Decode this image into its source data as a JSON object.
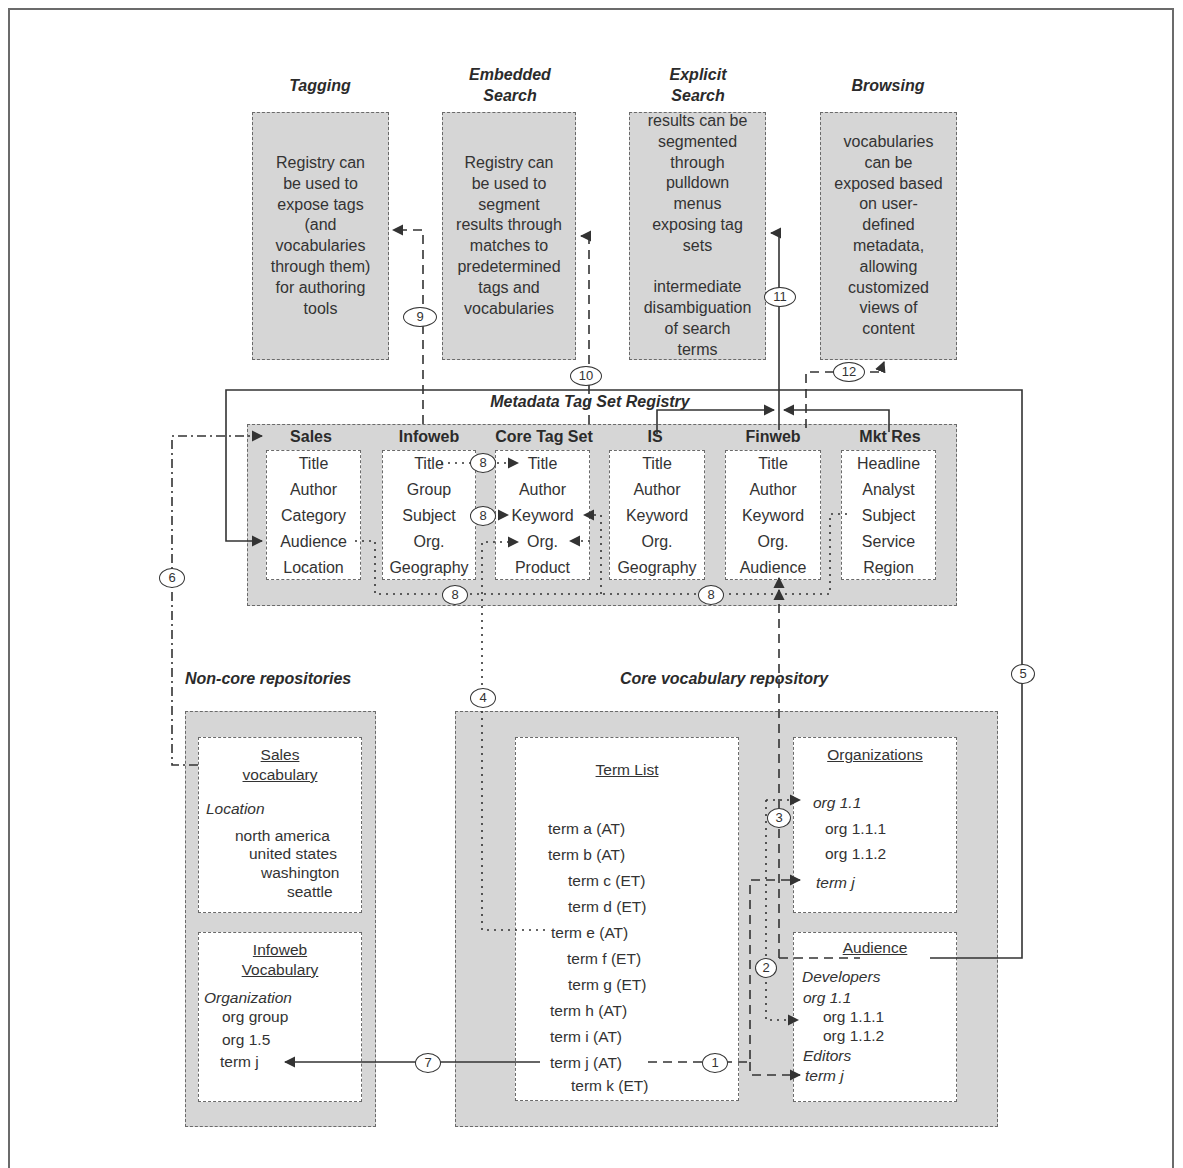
{
  "use_cases": [
    {
      "id": "tagging",
      "heading": "Tagging",
      "text": [
        "Registry can",
        "be used to",
        "expose tags",
        "(and",
        "vocabularies",
        "through them)",
        "for authoring",
        "tools"
      ]
    },
    {
      "id": "embedded-search",
      "heading": "Embedded Search",
      "heading_lines": [
        "Embedded",
        "Search"
      ],
      "text": [
        "Registry can",
        "be used to",
        "segment",
        "results through",
        "matches to",
        "predetermined",
        "tags and",
        "vocabularies"
      ]
    },
    {
      "id": "explicit-search",
      "heading": "Explicit Search",
      "heading_lines": [
        "Explicit",
        "Search"
      ],
      "text": [
        "results can be",
        "segmented",
        "through",
        "pulldown",
        "menus",
        "exposing tag",
        "sets",
        "",
        "intermediate",
        "disambiguation",
        "of search",
        "terms"
      ]
    },
    {
      "id": "browsing",
      "heading": "Browsing",
      "text": [
        "vocabularies",
        "can be",
        "exposed based",
        "on user-",
        "defined",
        "metadata,",
        "allowing",
        "customized",
        "views of",
        "content"
      ]
    }
  ],
  "registry": {
    "title": "Metadata Tag Set Registry",
    "tag_sets": [
      {
        "name": "Sales",
        "fields": [
          "Title",
          "Author",
          "Category",
          "Audience",
          "Location"
        ]
      },
      {
        "name": "Infoweb",
        "fields": [
          "Title",
          "Group",
          "Subject",
          "Org.",
          "Geography"
        ]
      },
      {
        "name": "Core Tag Set",
        "fields": [
          "Title",
          "Author",
          "Keyword",
          "Org.",
          "Product"
        ]
      },
      {
        "name": "IS",
        "fields": [
          "Title",
          "Author",
          "Keyword",
          "Org.",
          "Geography"
        ]
      },
      {
        "name": "Finweb",
        "fields": [
          "Title",
          "Author",
          "Keyword",
          "Org.",
          "Audience"
        ]
      },
      {
        "name": "Mkt Res",
        "fields": [
          "Headline",
          "Analyst",
          "Subject",
          "Service",
          "Region"
        ]
      }
    ]
  },
  "non_core": {
    "title": "Non-core repositories",
    "sales_vocab": {
      "title_lines": [
        "Sales",
        "vocabulary"
      ],
      "category": "Location",
      "terms": [
        "north america",
        "united states",
        "washington",
        "seattle"
      ]
    },
    "infoweb_vocab": {
      "title_lines": [
        "Infoweb",
        "Vocabulary"
      ],
      "category": "Organization",
      "terms": [
        "org group",
        "org 1.5",
        "term j"
      ]
    }
  },
  "core": {
    "title": "Core vocabulary repository",
    "term_list": {
      "title": "Term List",
      "terms": [
        "term a (AT)",
        "term b (AT)",
        "term c (ET)",
        "term d (ET)",
        "term e (AT)",
        "term f (ET)",
        "term g (ET)",
        "term h (AT)",
        "term i (AT)",
        "term j (AT)",
        "term k (ET)"
      ]
    },
    "organizations": {
      "title": "Organizations",
      "items": [
        "org 1.1",
        "org 1.1.1",
        "org 1.1.2",
        "term j"
      ]
    },
    "audience": {
      "title": "Audience",
      "items": [
        "Developers",
        "org 1.1",
        "org 1.1.1",
        "org 1.1.2",
        "Editors",
        "term j"
      ]
    }
  },
  "connectors": [
    "1",
    "2",
    "3",
    "4",
    "5",
    "6",
    "7",
    "8",
    "8",
    "8",
    "8",
    "9",
    "10",
    "11",
    "12"
  ],
  "colors": {
    "panel_gray": "#d6d6d6",
    "line": "#333333",
    "frame": "#6b6b6b"
  }
}
